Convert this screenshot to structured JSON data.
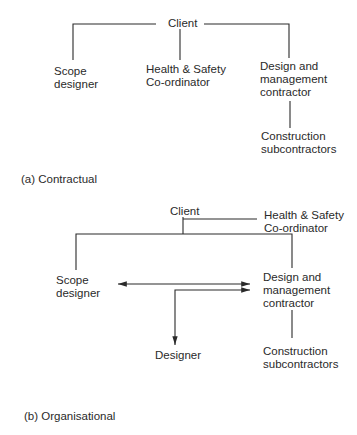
{
  "diagram_a": {
    "caption": "(a) Contractual",
    "nodes": {
      "client": "Client",
      "scope_designer": [
        "Scope",
        "designer"
      ],
      "health_safety": [
        "Health & Safety",
        "Co-ordinator"
      ],
      "dm_contractor": [
        "Design and",
        "management",
        "contractor"
      ],
      "construction_sub": [
        "Construction",
        "subcontractors"
      ]
    },
    "edges": [
      {
        "from": "Client",
        "to": "Scope designer"
      },
      {
        "from": "Client",
        "to": "Health & Safety Co-ordinator"
      },
      {
        "from": "Client",
        "to": "Design and management contractor"
      },
      {
        "from": "Design and management contractor",
        "to": "Construction subcontractors"
      }
    ]
  },
  "diagram_b": {
    "caption": "(b) Organisational",
    "nodes": {
      "client": "Client",
      "health_safety": [
        "Health & Safety",
        "Co-ordinator"
      ],
      "scope_designer": [
        "Scope",
        "designer"
      ],
      "dm_contractor": [
        "Design and",
        "management",
        "contractor"
      ],
      "designer": "Designer",
      "construction_sub": [
        "Construction",
        "subcontractors"
      ]
    },
    "edges": [
      {
        "from": "Client",
        "to": "Health & Safety Co-ordinator"
      },
      {
        "from": "Client",
        "to": "Scope designer"
      },
      {
        "from": "Client",
        "to": "Design and management contractor"
      },
      {
        "from": "Scope designer",
        "to": "Design and management contractor",
        "type": "bidirectional-arrow"
      },
      {
        "from": "Designer",
        "to": "Design and management contractor",
        "type": "bidirectional-arrow"
      },
      {
        "from": "Design and management contractor",
        "to": "Construction subcontractors"
      }
    ]
  }
}
